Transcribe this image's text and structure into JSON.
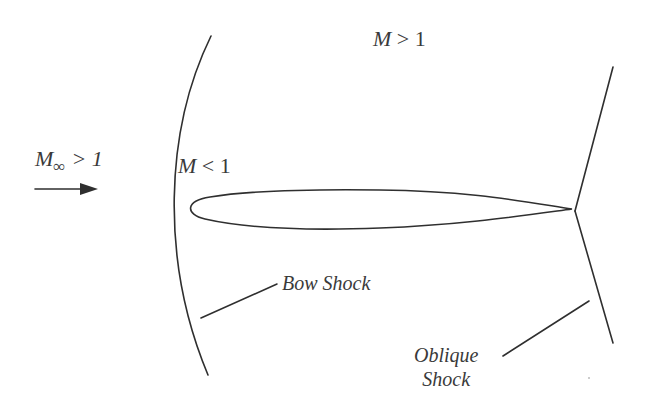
{
  "diagram": {
    "labels": {
      "freestream": {
        "M": "M",
        "sub": "∞",
        "rest": "> 1"
      },
      "supersonic_region": {
        "M": "M",
        "rest": " > 1"
      },
      "subsonic_region": {
        "M": "M",
        "rest": " < 1"
      },
      "bow_shock": "Bow Shock",
      "oblique_shock_line1": "Oblique",
      "oblique_shock_line2": "Shock"
    },
    "colors": {
      "stroke": "#2f2f2f",
      "text": "#3a3a3a",
      "background": "#ffffff"
    }
  }
}
